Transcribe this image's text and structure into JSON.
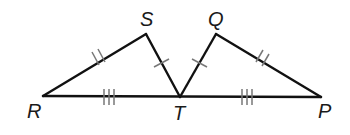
{
  "diagram": {
    "type": "geometry",
    "points": {
      "R": {
        "label": "R",
        "x": 43,
        "y": 96
      },
      "S": {
        "label": "S",
        "x": 146,
        "y": 34
      },
      "T": {
        "label": "T",
        "x": 180,
        "y": 97
      },
      "Q": {
        "label": "Q",
        "x": 216,
        "y": 34
      },
      "P": {
        "label": "P",
        "x": 321,
        "y": 97
      }
    },
    "segments": [
      {
        "from": "R",
        "to": "S",
        "ticks": 2
      },
      {
        "from": "S",
        "to": "T",
        "ticks": 1
      },
      {
        "from": "R",
        "to": "T",
        "ticks": 3
      },
      {
        "from": "T",
        "to": "Q",
        "ticks": 1
      },
      {
        "from": "Q",
        "to": "P",
        "ticks": 2
      },
      {
        "from": "T",
        "to": "P",
        "ticks": 3
      }
    ],
    "congruences": [
      "RS ≅ QP",
      "ST ≅ QT",
      "RT ≅ TP"
    ]
  }
}
